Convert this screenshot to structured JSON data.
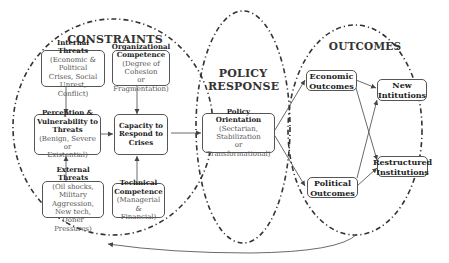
{
  "sections": {
    "constraints": "CONSTRAINTS",
    "policy_response_line1": "POLICY",
    "policy_response_line2": "RESPONSE",
    "outcomes": "OUTCOMES"
  },
  "nodes": {
    "internal_threats": {
      "title": "Internal Threats",
      "detail_1": "(Economic & Political",
      "detail_2": "Crises, Social Unrest,",
      "detail_3": "Conflict)"
    },
    "org_competence": {
      "title_1": "Organizational",
      "title_2": "Competence",
      "detail_1": "(Degree of Cohesion",
      "detail_2": "or Fragmentation)"
    },
    "perception": {
      "title_1": "Perception &",
      "title_2": "Vulnerability to Threats",
      "detail_1": "(Benign, Severe or",
      "detail_2": "Existential)"
    },
    "capacity": {
      "title_1": "Capacity to",
      "title_2": "Respond to",
      "title_3": "Crises"
    },
    "external_threats": {
      "title": "External Threats",
      "detail_1": "(Oil shocks, Military",
      "detail_2": "Aggression, New tech,",
      "detail_3": "Doner Pressures)"
    },
    "technical_competence": {
      "title_1": "Technical",
      "title_2": "Competence",
      "detail_1": "(Managerial &",
      "detail_2": "Financial)"
    },
    "policy_orientation": {
      "title": "Policy Orientation",
      "detail_1": "(Sectarian, Stabilization",
      "detail_2": "or Transformational)"
    },
    "economic_outcomes": {
      "title_1": "Economic",
      "title_2": "Outcomes"
    },
    "political_outcomes": {
      "title_1": "Political",
      "title_2": "Outcomes"
    },
    "new_institutions": {
      "title_1": "New",
      "title_2": "Intitutions"
    },
    "restructured_institutions": {
      "title_1": "Restructured",
      "title_2": "Institutions"
    }
  },
  "edges": [
    {
      "from": "internal_threats",
      "to": "perception"
    },
    {
      "from": "org_competence",
      "to": "capacity"
    },
    {
      "from": "external_threats",
      "to": "perception"
    },
    {
      "from": "technical_competence",
      "to": "capacity"
    },
    {
      "from": "perception",
      "to": "capacity"
    },
    {
      "from": "capacity",
      "to": "policy_orientation"
    },
    {
      "from": "policy_orientation",
      "to": "economic_outcomes"
    },
    {
      "from": "policy_orientation",
      "to": "political_outcomes"
    },
    {
      "from": "economic_outcomes",
      "to": "new_institutions"
    },
    {
      "from": "economic_outcomes",
      "to": "restructured_institutions"
    },
    {
      "from": "political_outcomes",
      "to": "new_institutions"
    },
    {
      "from": "political_outcomes",
      "to": "restructured_institutions"
    },
    {
      "from": "outcomes",
      "to": "constraints",
      "type": "feedback"
    }
  ],
  "colors": {
    "line": "#444444",
    "box_border": "#555555",
    "text_heading": "#222222",
    "text_detail": "#555555"
  }
}
